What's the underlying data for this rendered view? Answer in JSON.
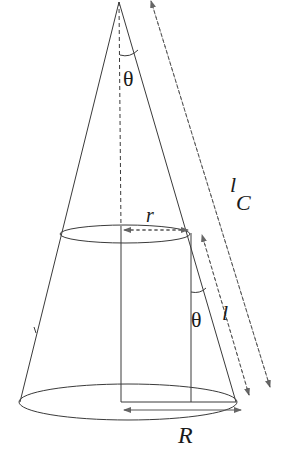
{
  "diagram": {
    "type": "cone-geometry",
    "labels": {
      "theta_top": "θ",
      "theta_side": "θ",
      "r": "r",
      "R": "R",
      "l": "l",
      "lC_l": "l",
      "lC_sub": "C"
    },
    "colors": {
      "line": "#3a3a3a",
      "dash": "#555555",
      "text": "#1a1a1a",
      "background": "#ffffff"
    }
  }
}
